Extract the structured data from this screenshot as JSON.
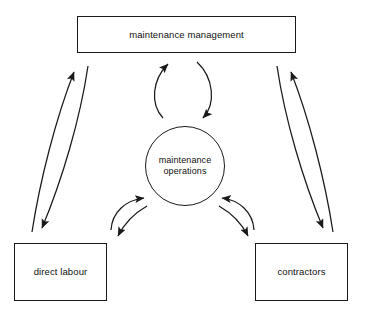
{
  "diagram": {
    "background_color": "#ffffff",
    "line_color": "#1a1a1a",
    "text_color": "#111111",
    "nodes": [
      {
        "id": "management",
        "shape": "rectangle",
        "label": "maintenance management"
      },
      {
        "id": "operations",
        "shape": "ellipse",
        "label_line1": "maintenance",
        "label_line2": "operations"
      },
      {
        "id": "direct_labour",
        "shape": "rectangle",
        "label": "direct labour"
      },
      {
        "id": "contractors",
        "shape": "rectangle",
        "label": "contractors"
      }
    ],
    "connectors": [
      {
        "id": "operations-to-management",
        "from": "operations",
        "to": "management",
        "style": "curved-arrow",
        "arrowhead": "end"
      },
      {
        "id": "management-to-operations",
        "from": "management",
        "to": "operations",
        "style": "curved-arrow",
        "arrowhead": "end"
      },
      {
        "id": "direct-labour-to-management",
        "from": "direct_labour",
        "to": "management",
        "style": "curved-arrow",
        "arrowhead": "end"
      },
      {
        "id": "management-to-direct-labour",
        "from": "management",
        "to": "direct_labour",
        "style": "curved-arrow",
        "arrowhead": "end"
      },
      {
        "id": "contractors-to-management",
        "from": "contractors",
        "to": "management",
        "style": "curved-arrow",
        "arrowhead": "end"
      },
      {
        "id": "management-to-contractors",
        "from": "management",
        "to": "contractors",
        "style": "curved-arrow",
        "arrowhead": "end"
      },
      {
        "id": "direct-labour-to-operations",
        "from": "direct_labour",
        "to": "operations",
        "style": "curved-arrow",
        "arrowhead": "end"
      },
      {
        "id": "operations-to-direct-labour",
        "from": "operations",
        "to": "direct_labour",
        "style": "curved-arrow",
        "arrowhead": "end"
      },
      {
        "id": "contractors-to-operations",
        "from": "contractors",
        "to": "operations",
        "style": "curved-arrow",
        "arrowhead": "end"
      },
      {
        "id": "operations-to-contractors",
        "from": "operations",
        "to": "contractors",
        "style": "curved-arrow",
        "arrowhead": "end"
      }
    ]
  }
}
